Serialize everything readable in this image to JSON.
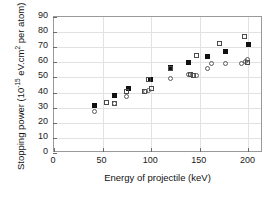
{
  "chart_data": {
    "type": "scatter",
    "title": "",
    "xlabel": "Energy of projectile (keV)",
    "ylabel": "Stopping power (10-15 eV.cm2 per atom)",
    "ylabel_parts": {
      "prefix": "Stopping power (10",
      "exponent": "-15",
      "suffix": " eV.cm",
      "exponent2": "2",
      "suffix2": " per atom)"
    },
    "xlim": [
      0,
      215
    ],
    "ylim": [
      0,
      90
    ],
    "xticks": [
      0,
      50,
      100,
      150,
      200
    ],
    "yticks": [
      0,
      10,
      20,
      30,
      40,
      50,
      60,
      70,
      80,
      90
    ],
    "xtick_labels": [
      "0",
      "50",
      "100",
      "150",
      "200"
    ],
    "ytick_labels": [
      "0",
      "10",
      "20",
      "30",
      "40",
      "50",
      "60",
      "70",
      "80",
      "90"
    ],
    "grid": true,
    "legend": "none",
    "series": [
      {
        "name": "filled-square",
        "marker": "filled-square",
        "color": "#111111",
        "points": [
          [
            42,
            31.2
          ],
          [
            62,
            38.3
          ],
          [
            77,
            43.0
          ],
          [
            99,
            48.7
          ],
          [
            120,
            56.4
          ],
          [
            138,
            60.2
          ],
          [
            158,
            63.9
          ],
          [
            176,
            67.5
          ],
          [
            200,
            71.5
          ]
        ]
      },
      {
        "name": "open-square",
        "marker": "open-square",
        "color": "#4a4a4a",
        "points": [
          [
            54,
            33.2
          ],
          [
            62,
            33.0
          ],
          [
            75,
            40.8
          ],
          [
            97,
            48.8
          ],
          [
            100,
            42.4
          ],
          [
            120,
            56.2
          ],
          [
            140,
            52.0
          ],
          [
            147,
            64.5
          ],
          [
            170,
            72.2
          ],
          [
            196,
            77.0
          ],
          [
            199,
            60.0
          ],
          [
            144,
            51.2
          ],
          [
            93,
            41.0
          ]
        ]
      },
      {
        "name": "open-circle",
        "marker": "open-circle",
        "color": "#5a5a5a",
        "points": [
          [
            42,
            27.2
          ],
          [
            62,
            33.0
          ],
          [
            75,
            37.3
          ],
          [
            94,
            40.8
          ],
          [
            97,
            41.5
          ],
          [
            120,
            49.3
          ],
          [
            138,
            52.2
          ],
          [
            143,
            51.2
          ],
          [
            147,
            51.0
          ],
          [
            158,
            55.6
          ],
          [
            162,
            59.0
          ],
          [
            176,
            59.0
          ],
          [
            193,
            59.3
          ],
          [
            199,
            61.8
          ],
          [
            197,
            60.6
          ]
        ]
      }
    ]
  }
}
